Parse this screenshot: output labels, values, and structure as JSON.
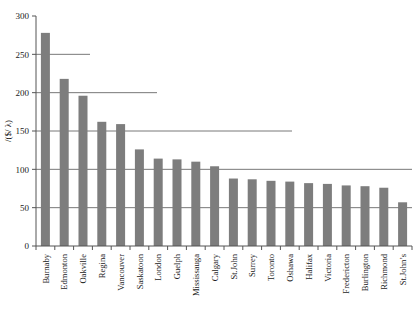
{
  "chart_data": {
    "type": "bar",
    "title": "",
    "subtitle": "",
    "xlabel": "",
    "ylabel": "/($/ λ)",
    "ylim": [
      0,
      300
    ],
    "yticks": [
      0,
      50,
      100,
      150,
      200,
      250,
      300
    ],
    "ytick_labels": [
      "0",
      "50",
      "100",
      "150",
      "200",
      "250",
      "300"
    ],
    "grid": true,
    "grid_axis": "y",
    "legend": false,
    "legend_position": "none",
    "bar_color": "#7d7d7d",
    "axis_color": "#555555",
    "categories": [
      "Burnaby",
      "Edmonton",
      "Oakville",
      "Regina",
      "Vancouver",
      "Saskatoon",
      "London",
      "Guelph",
      "Mississauga",
      "Calgary",
      "St.John",
      "Surrey",
      "Toronto",
      "Oshawa",
      "Halifax",
      "Victoria",
      "Fredericton",
      "Burlington",
      "Richmond",
      "St.John’s"
    ],
    "values": [
      278,
      218,
      196,
      162,
      159,
      126,
      114,
      113,
      110,
      104,
      88,
      87,
      85,
      84,
      82,
      81,
      79,
      78,
      76,
      57
    ]
  }
}
